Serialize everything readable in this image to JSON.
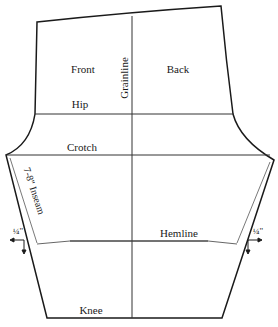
{
  "diagram": {
    "type": "sewing-pattern",
    "labels": {
      "front": "Front",
      "back": "Back",
      "grainline": "Grainline",
      "hip": "Hip",
      "crotch": "Crotch",
      "inseam": "7-8\" Inseam",
      "hemline": "Hemline",
      "knee": "Knee",
      "left_allowance": "¼\"",
      "right_allowance": "¼\""
    },
    "colors": {
      "outline": "#1a1a1a",
      "guide": "#333333",
      "hem_guide": "#555555",
      "background": "#ffffff"
    }
  }
}
